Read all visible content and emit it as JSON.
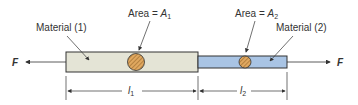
{
  "diagram": {
    "force_left_label": "F",
    "force_right_label": "F",
    "material1_label": "Material (1)",
    "material2_label": "Material (2)",
    "area1_label_prefix": "Area = ",
    "area1_symbol": "A",
    "area1_subscript": "1",
    "area2_label_prefix": "Area = ",
    "area2_symbol": "A",
    "area2_subscript": "2",
    "length1_symbol": "l",
    "length1_subscript": "1",
    "length2_symbol": "l",
    "length2_subscript": "2",
    "colors": {
      "material1_fill": "#e4e4d6",
      "material2_fill": "#a9c4e4",
      "cross_section_fill": "#e0a860",
      "outline": "#333333"
    }
  }
}
